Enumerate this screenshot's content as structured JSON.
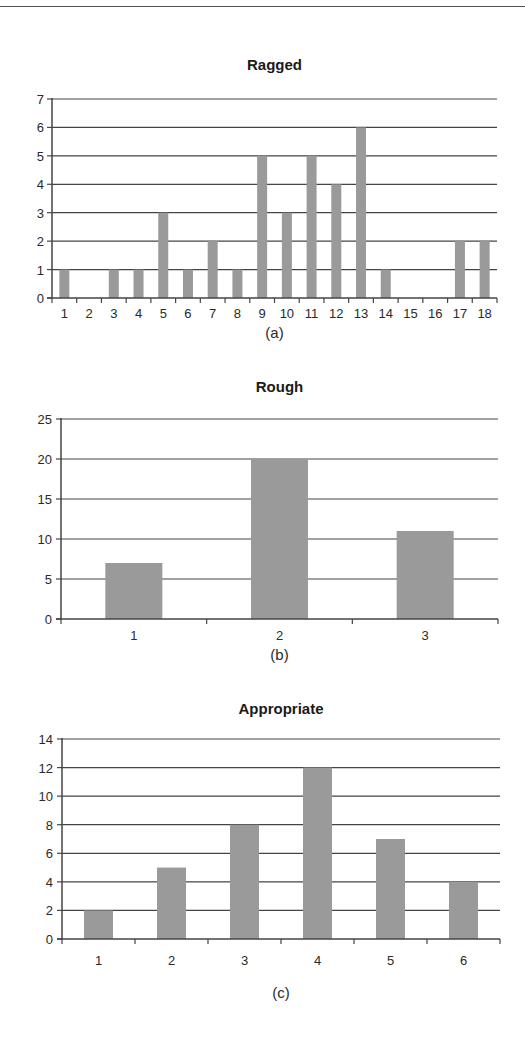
{
  "figure": {
    "rule_color": "#555555",
    "bar_color": "#9a9a9a",
    "grid_color": "#444444"
  },
  "chart_data": [
    {
      "type": "bar",
      "title": "Ragged",
      "caption": "(a)",
      "xlabel": "",
      "ylabel": "",
      "categories": [
        "1",
        "2",
        "3",
        "4",
        "5",
        "6",
        "7",
        "8",
        "9",
        "10",
        "11",
        "12",
        "13",
        "14",
        "15",
        "16",
        "17",
        "18"
      ],
      "values": [
        1,
        0,
        1,
        1,
        3,
        1,
        2,
        1,
        5,
        3,
        5,
        4,
        6,
        1,
        0,
        0,
        2,
        2
      ],
      "ylim": [
        0,
        7
      ],
      "yticks": [
        0,
        1,
        2,
        3,
        4,
        5,
        6,
        7
      ],
      "grid": true,
      "legend": "none",
      "layout": {
        "x0": 52,
        "x1": 497,
        "y_top": 99,
        "y_zero": 298,
        "bar_w": 10,
        "title_y": 70,
        "caption_y": 338,
        "label_y": 318,
        "ylabel_x": 44
      }
    },
    {
      "type": "bar",
      "title": "Rough",
      "caption": "(b)",
      "xlabel": "",
      "ylabel": "",
      "categories": [
        "1",
        "2",
        "3"
      ],
      "values": [
        7,
        20,
        11
      ],
      "ylim": [
        0,
        25
      ],
      "yticks": [
        0,
        5,
        10,
        15,
        20,
        25
      ],
      "grid": true,
      "legend": "none",
      "layout": {
        "x0": 61,
        "x1": 498,
        "y_top": 419,
        "y_zero": 619,
        "bar_w": 57,
        "title_y": 392,
        "caption_y": 660,
        "label_y": 640,
        "ylabel_x": 52
      }
    },
    {
      "type": "bar",
      "title": "Appropriate",
      "caption": "(c)",
      "xlabel": "",
      "ylabel": "",
      "categories": [
        "1",
        "2",
        "3",
        "4",
        "5",
        "6"
      ],
      "values": [
        2,
        5,
        8,
        12,
        7,
        4
      ],
      "ylim": [
        0,
        14
      ],
      "yticks": [
        0,
        2,
        4,
        6,
        8,
        10,
        12,
        14
      ],
      "grid": true,
      "legend": "none",
      "layout": {
        "x0": 62,
        "x1": 500,
        "y_top": 739,
        "y_zero": 939,
        "bar_w": 29,
        "title_y": 714,
        "caption_y": 998,
        "label_y": 965,
        "ylabel_x": 53
      }
    }
  ]
}
